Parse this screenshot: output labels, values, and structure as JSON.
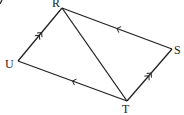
{
  "diagram": {
    "type": "parallelogram-with-diagonal",
    "vertices": [
      {
        "id": "R",
        "label": "R"
      },
      {
        "id": "S",
        "label": "S"
      },
      {
        "id": "T",
        "label": "T"
      },
      {
        "id": "U",
        "label": "U"
      }
    ],
    "edges": [
      {
        "from": "U",
        "to": "R",
        "marker": "double-arrow",
        "direction": "toward R"
      },
      {
        "from": "R",
        "to": "S",
        "marker": "single-arrow",
        "direction": "toward R"
      },
      {
        "from": "T",
        "to": "S",
        "marker": "double-arrow",
        "direction": "toward S"
      },
      {
        "from": "U",
        "to": "T",
        "marker": "single-arrow",
        "direction": "toward U"
      },
      {
        "from": "R",
        "to": "T",
        "marker": "none"
      }
    ]
  }
}
